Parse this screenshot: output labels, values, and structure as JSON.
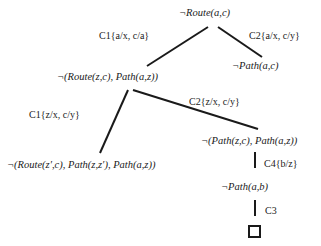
{
  "diagram": {
    "type": "resolution-refutation-tree",
    "nodes": {
      "root": "¬Route(a,c)",
      "right_child": "¬Path(a,c)",
      "left_child": "¬(Route(z,c), Path(a,z))",
      "left_leaf": "¬(Route(z′,c), Path(z,z′), Path(a,z))",
      "mid_right": "¬(Path(z,c), Path(a,z))",
      "path_ab": "¬Path(a,b)",
      "empty_clause": "□"
    },
    "edge_labels": {
      "c1_a": "C1{a/x, c/a}",
      "c2_a": "C2{a/x, c/y}",
      "c1_z": "C1{z/x, c/y}",
      "c2_z": "C2{z/x, c/y}",
      "c4_b": "C4{b/z}",
      "c3": "C3"
    },
    "colors": {
      "ink": "#1a1a1a",
      "background": "#ffffff"
    }
  }
}
